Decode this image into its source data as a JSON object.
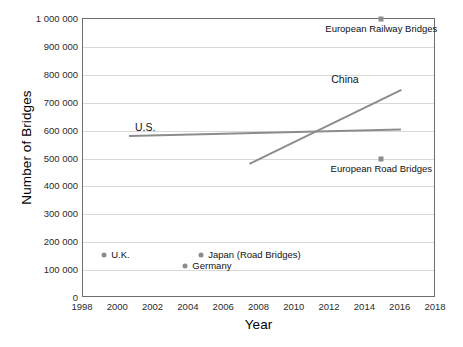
{
  "chart_data": {
    "type": "scatter",
    "title": "",
    "xlabel": "Year",
    "ylabel": "Number of Bridges",
    "xlim": [
      1998,
      2018
    ],
    "ylim": [
      0,
      1000000
    ],
    "grid": true,
    "legend": "inline-annotations",
    "xticks": [
      "1998",
      "2000",
      "2002",
      "2004",
      "2006",
      "2008",
      "2010",
      "2012",
      "2014",
      "2016",
      "2018"
    ],
    "yticks": [
      "0",
      "100 000",
      "200 000",
      "300 000",
      "400 000",
      "500 000",
      "600 000",
      "700 000",
      "800 000",
      "900 000",
      "1 000 000"
    ],
    "series": [
      {
        "name": "U.S.",
        "type": "line",
        "color": "#8c8c8c",
        "label": "U.S.",
        "points": [
          {
            "x": 2000.6,
            "y": 585000
          },
          {
            "x": 2016.0,
            "y": 608000
          }
        ]
      },
      {
        "name": "China",
        "type": "line",
        "color": "#8c8c8c",
        "label": "China",
        "points": [
          {
            "x": 2007.4,
            "y": 485000
          },
          {
            "x": 2016.0,
            "y": 750000
          }
        ]
      },
      {
        "name": "U.K.",
        "type": "point",
        "marker": "circle",
        "color": "#8c8c8c",
        "label": "U.K.",
        "points": [
          {
            "x": 1999.2,
            "y": 155000
          }
        ]
      },
      {
        "name": "Japan (Road Bridges)",
        "type": "point",
        "marker": "circle",
        "color": "#8c8c8c",
        "label": "Japan (Road Bridges)",
        "points": [
          {
            "x": 2004.7,
            "y": 155000
          }
        ]
      },
      {
        "name": "Germany",
        "type": "point",
        "marker": "circle",
        "color": "#8c8c8c",
        "label": "Germany",
        "points": [
          {
            "x": 2003.8,
            "y": 113000
          }
        ]
      },
      {
        "name": "European Railway Bridges",
        "type": "point",
        "marker": "square",
        "color": "#8c8c8c",
        "label": "European Railway Bridges",
        "points": [
          {
            "x": 2014.9,
            "y": 1000000
          }
        ]
      },
      {
        "name": "European Road Bridges",
        "type": "point",
        "marker": "square",
        "color": "#8c8c8c",
        "label": "European Road Bridges",
        "points": [
          {
            "x": 2014.9,
            "y": 500000
          }
        ]
      }
    ]
  }
}
